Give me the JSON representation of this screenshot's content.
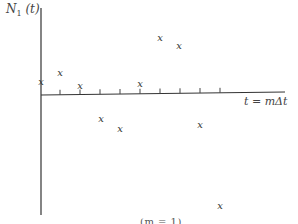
{
  "chart_data": {
    "type": "scatter",
    "title": "",
    "ylabel": "N_1(t)",
    "ylabel_main": "N",
    "ylabel_sub": "1",
    "ylabel_arg": " (t)",
    "xlabel": "t = mΔt",
    "marker": "x",
    "grid": false,
    "legend": "none",
    "x_ticks_count": 9,
    "x": [
      0,
      1,
      2,
      3,
      4,
      5,
      6,
      7,
      8,
      9
    ],
    "values": [
      0.6,
      1.1,
      0.45,
      -1.2,
      -1.7,
      0.55,
      2.9,
      2.5,
      -1.5,
      -5.7
    ],
    "points_px": [
      {
        "x": 41,
        "y": 82
      },
      {
        "x": 60,
        "y": 73
      },
      {
        "x": 80,
        "y": 86
      },
      {
        "x": 101,
        "y": 119
      },
      {
        "x": 120,
        "y": 129
      },
      {
        "x": 140,
        "y": 84
      },
      {
        "x": 160,
        "y": 38
      },
      {
        "x": 179,
        "y": 46
      },
      {
        "x": 200,
        "y": 125
      },
      {
        "x": 220,
        "y": 206
      }
    ],
    "caption_partial": "(m = 1)"
  },
  "axis": {
    "x_start": 41,
    "x_end": 285,
    "y_left": 95,
    "y_right": 92,
    "y_axis_x": 41,
    "y_axis_top": 8,
    "y_axis_bottom": 215,
    "tick_xs": [
      60,
      80,
      100,
      120,
      140,
      160,
      180,
      200,
      220
    ],
    "color": "#333333"
  },
  "labels": {
    "marker_glyph": "x"
  }
}
